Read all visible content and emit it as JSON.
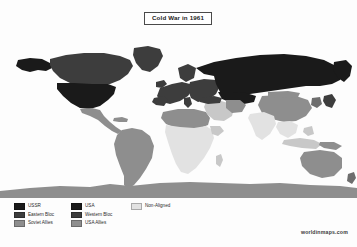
{
  "title": {
    "text": "Cold War in 1961"
  },
  "watermark": {
    "text": "worldinmaps.com"
  },
  "legend": {
    "rows": [
      [
        {
          "label": "USSR",
          "color": "#1a1a1a"
        },
        {
          "label": "USA",
          "color": "#1a1a1a"
        },
        {
          "label": "Non-Aligned",
          "color": "#e2e2e2"
        }
      ],
      [
        {
          "label": "Eastern Bloc",
          "color": "#3d3d3d"
        },
        {
          "label": "Western Bloc",
          "color": "#3d3d3d"
        },
        {
          "label": "",
          "color": ""
        }
      ],
      [
        {
          "label": "Soviet Allies",
          "color": "#8e8e8e"
        },
        {
          "label": "USA Allies",
          "color": "#8e8e8e"
        },
        {
          "label": "",
          "color": ""
        }
      ]
    ]
  },
  "map": {
    "projection": "equirectangular",
    "ocean_color": "#fdfdfd",
    "categories": [
      {
        "key": "ussr",
        "label": "USSR",
        "color": "#1a1a1a"
      },
      {
        "key": "usa",
        "label": "USA",
        "color": "#1a1a1a"
      },
      {
        "key": "eastern_bloc",
        "label": "Eastern Bloc",
        "color": "#3d3d3d"
      },
      {
        "key": "western_bloc",
        "label": "Western Bloc",
        "color": "#3d3d3d"
      },
      {
        "key": "soviet_allies",
        "label": "Soviet Allies",
        "color": "#8e8e8e"
      },
      {
        "key": "usa_allies",
        "label": "USA Allies",
        "color": "#8e8e8e"
      },
      {
        "key": "non_aligned",
        "label": "Non-Aligned",
        "color": "#e2e2e2"
      },
      {
        "key": "antarctica",
        "label": "Antarctica",
        "color": "#8e8e8e"
      }
    ],
    "regions": [
      {
        "name": "ussr",
        "category": "ussr"
      },
      {
        "name": "usa-contiguous",
        "category": "usa"
      },
      {
        "name": "alaska",
        "category": "usa"
      },
      {
        "name": "eastern-europe",
        "category": "eastern_bloc"
      },
      {
        "name": "canada",
        "category": "western_bloc"
      },
      {
        "name": "greenland",
        "category": "western_bloc"
      },
      {
        "name": "western-europe",
        "category": "western_bloc"
      },
      {
        "name": "south-america",
        "category": "usa_allies"
      },
      {
        "name": "australia",
        "category": "usa_allies"
      },
      {
        "name": "japan",
        "category": "western_bloc"
      },
      {
        "name": "china",
        "category": "soviet_allies"
      },
      {
        "name": "mongolia",
        "category": "soviet_allies"
      },
      {
        "name": "north-africa",
        "category": "soviet_allies"
      },
      {
        "name": "sub-saharan-africa",
        "category": "non_aligned"
      },
      {
        "name": "india",
        "category": "non_aligned"
      },
      {
        "name": "southeast-asia",
        "category": "non_aligned"
      },
      {
        "name": "antarctica",
        "category": "antarctica"
      }
    ]
  }
}
